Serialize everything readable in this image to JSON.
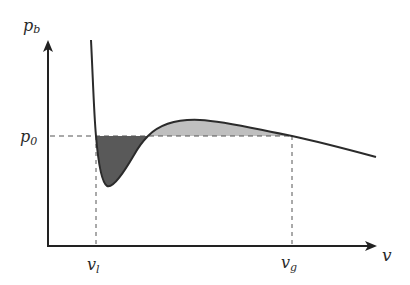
{
  "figure": {
    "type": "pv-isotherm-maxwell-construction",
    "axes": {
      "y_label": "p",
      "y_label_sub": "b",
      "x_label": "v"
    },
    "levels": {
      "p0_label": "p",
      "p0_sub": "0"
    },
    "ticks": {
      "vl_label": "v",
      "vl_sub": "l",
      "vg_label": "v",
      "vg_sub": "g"
    },
    "regions": [
      {
        "name": "dark-area-below-p0",
        "color": "#595959"
      },
      {
        "name": "light-area-above-p0",
        "color": "#bfbfbf"
      }
    ],
    "colors": {
      "curve": "#2b2b2b",
      "axis": "#222222",
      "dashed": "#555555"
    }
  }
}
